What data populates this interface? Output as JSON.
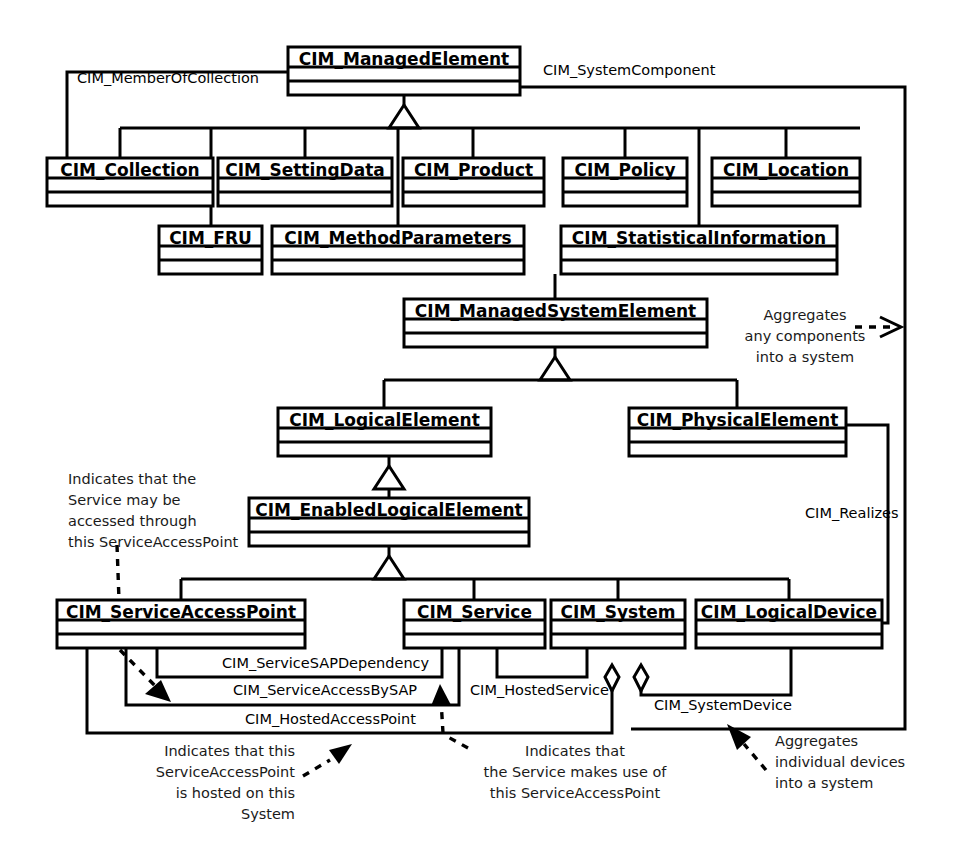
{
  "diagram": {
    "type": "uml-class-diagram",
    "background": "#ffffff",
    "line_color": "#000000"
  },
  "classes": [
    {
      "id": "managed_element",
      "name": "CIM_ManagedElement",
      "x": 288,
      "y": 47,
      "w": 232,
      "h": 48
    },
    {
      "id": "collection",
      "name": "CIM_Collection",
      "x": 47,
      "y": 158,
      "w": 166,
      "h": 48
    },
    {
      "id": "setting_data",
      "name": "CIM_SettingData",
      "x": 218,
      "y": 158,
      "w": 174,
      "h": 48
    },
    {
      "id": "product",
      "name": "CIM_Product",
      "x": 403,
      "y": 158,
      "w": 141,
      "h": 48
    },
    {
      "id": "policy",
      "name": "CIM_Policy",
      "x": 563,
      "y": 158,
      "w": 124,
      "h": 48
    },
    {
      "id": "location",
      "name": "CIM_Location",
      "x": 712,
      "y": 158,
      "w": 148,
      "h": 48
    },
    {
      "id": "fru",
      "name": "CIM_FRU",
      "x": 159,
      "y": 226,
      "w": 103,
      "h": 48
    },
    {
      "id": "method_parameters",
      "name": "CIM_MethodParameters",
      "x": 272,
      "y": 226,
      "w": 252,
      "h": 48
    },
    {
      "id": "statistical_information",
      "name": "CIM_StatisticalInformation",
      "x": 561,
      "y": 226,
      "w": 276,
      "h": 48
    },
    {
      "id": "managed_system_element",
      "name": "CIM_ManagedSystemElement",
      "x": 404,
      "y": 299,
      "w": 303,
      "h": 48
    },
    {
      "id": "logical_element",
      "name": "CIM_LogicalElement",
      "x": 278,
      "y": 408,
      "w": 213,
      "h": 48
    },
    {
      "id": "physical_element",
      "name": "CIM_PhysicalElement",
      "x": 629,
      "y": 408,
      "w": 217,
      "h": 48
    },
    {
      "id": "enabled_logical_element",
      "name": "CIM_EnabledLogicalElement",
      "x": 249,
      "y": 498,
      "w": 280,
      "h": 48
    },
    {
      "id": "service_access_point",
      "name": "CIM_ServiceAccessPoint",
      "x": 57,
      "y": 600,
      "w": 248,
      "h": 48
    },
    {
      "id": "service",
      "name": "CIM_Service",
      "x": 404,
      "y": 600,
      "w": 141,
      "h": 48
    },
    {
      "id": "system",
      "name": "CIM_System",
      "x": 551,
      "y": 600,
      "w": 134,
      "h": 48
    },
    {
      "id": "logical_device",
      "name": "CIM_LogicalDevice",
      "x": 696,
      "y": 600,
      "w": 186,
      "h": 48
    }
  ],
  "associations": [
    {
      "id": "member_of_collection",
      "label": "CIM_MemberOfCollection",
      "label_x": 77,
      "label_y": 79
    },
    {
      "id": "system_component",
      "label": "CIM_SystemComponent",
      "label_x": 543,
      "label_y": 71
    },
    {
      "id": "realizes",
      "label": "CIM_Realizes",
      "label_x": 805,
      "label_y": 514
    },
    {
      "id": "service_sap_dependency",
      "label": "CIM_ServiceSAPDependency",
      "label_x": 222,
      "label_y": 664
    },
    {
      "id": "service_access_by_sap",
      "label": "CIM_ServiceAccessBySAP",
      "label_x": 233,
      "label_y": 691
    },
    {
      "id": "hosted_service",
      "label": "CIM_HostedService",
      "label_x": 470,
      "label_y": 691
    },
    {
      "id": "hosted_access_point",
      "label": "CIM_HostedAccessPoint",
      "label_x": 245,
      "label_y": 720
    },
    {
      "id": "system_device",
      "label": "CIM_SystemDevice",
      "label_x": 654,
      "label_y": 706
    }
  ],
  "notes": [
    {
      "id": "note-service-accessed-through",
      "align": "start",
      "x": 68,
      "y": 480,
      "lines": [
        "Indicates that the",
        "Service may be",
        "accessed through",
        "this ServiceAccessPoint"
      ]
    },
    {
      "id": "note-aggregates-any-components",
      "align": "middle",
      "x": 805,
      "y": 316,
      "lines": [
        "Aggregates",
        "any components",
        "into a system"
      ]
    },
    {
      "id": "note-sap-hosted-on-system",
      "align": "end",
      "x": 295,
      "y": 752,
      "lines": [
        "Indicates that this",
        "ServiceAccessPoint",
        "is hosted on this",
        "System"
      ]
    },
    {
      "id": "note-service-makes-use-of",
      "align": "middle",
      "x": 575,
      "y": 752,
      "lines": [
        "Indicates that",
        "the Service makes use of",
        "this ServiceAccessPoint"
      ]
    },
    {
      "id": "note-aggregates-individual-devices",
      "align": "start",
      "x": 775,
      "y": 742,
      "lines": [
        "Aggregates",
        "individual devices",
        "into a system"
      ]
    }
  ]
}
